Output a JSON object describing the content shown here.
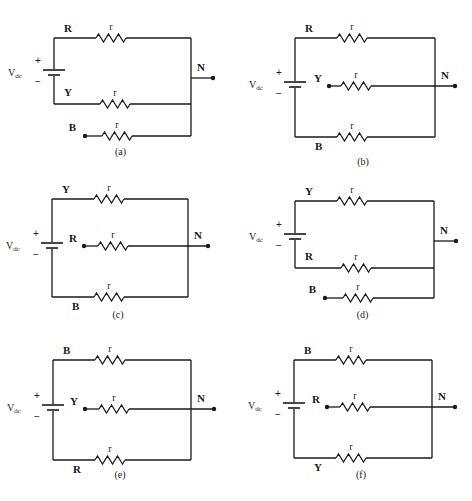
{
  "figure": {
    "source_label": "V",
    "source_sub": "dc",
    "plus": "+",
    "minus": "−",
    "resistor_label": "r",
    "neutral_label": "N",
    "panels": [
      {
        "id": "a",
        "caption": "(a)",
        "top_phase": "R",
        "middle_phase": "Y",
        "bottom_phase": "B",
        "layout": "open-bottom"
      },
      {
        "id": "b",
        "caption": "(b)",
        "top_phase": "R",
        "middle_phase": "Y",
        "bottom_phase": "B",
        "layout": "open-middle"
      },
      {
        "id": "c",
        "caption": "(c)",
        "top_phase": "Y",
        "middle_phase": "R",
        "bottom_phase": "B",
        "layout": "open-middle"
      },
      {
        "id": "d",
        "caption": "(d)",
        "top_phase": "Y",
        "middle_phase": "R",
        "bottom_phase": "B",
        "layout": "open-bottom"
      },
      {
        "id": "e",
        "caption": "(e)",
        "top_phase": "B",
        "middle_phase": "Y",
        "bottom_phase": "R",
        "layout": "open-middle"
      },
      {
        "id": "f",
        "caption": "(f)",
        "top_phase": "B",
        "middle_phase": "R",
        "bottom_phase": "Y",
        "layout": "open-middle"
      }
    ]
  }
}
